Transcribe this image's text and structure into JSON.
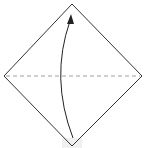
{
  "diagram": {
    "type": "origami-fold-step",
    "colors": {
      "outline": "#333333",
      "fold_line": "#888888",
      "arrow": "#222222",
      "background": "#ffffff"
    },
    "shape": {
      "top": [
        72,
        4
      ],
      "right": [
        142,
        76
      ],
      "bottom": [
        72,
        146
      ],
      "left": [
        4,
        76
      ]
    },
    "fold_line": {
      "style": "dashed",
      "from": [
        6,
        76
      ],
      "to": [
        140,
        76
      ]
    },
    "arrow": {
      "direction": "up",
      "from": [
        73,
        138
      ],
      "control": [
        50,
        78
      ],
      "to": [
        70,
        20
      ]
    }
  }
}
